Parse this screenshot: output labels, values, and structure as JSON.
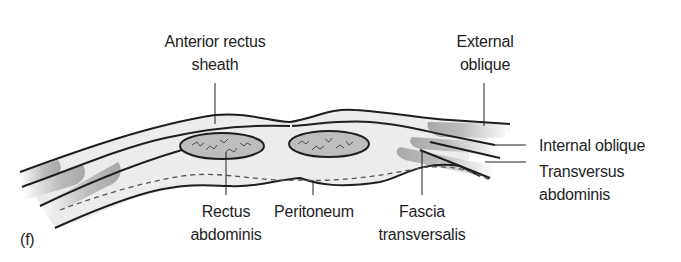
{
  "figure": {
    "panel_label": "(f)",
    "colors": {
      "outline": "#1e1e1e",
      "sheath_fill": "#ececec",
      "muscle_fill": "#c9c9c9",
      "rectus_fill": "#bdbdbd",
      "background": "#ffffff"
    },
    "labels": {
      "anterior_rectus_sheath": {
        "line1": "Anterior rectus",
        "line2": "sheath"
      },
      "external_oblique": {
        "line1": "External",
        "line2": "oblique"
      },
      "internal_oblique": {
        "line1": "Internal oblique"
      },
      "transversus_abdominis": {
        "line1": "Transversus",
        "line2": "abdominis"
      },
      "rectus_abdominis": {
        "line1": "Rectus",
        "line2": "abdominis"
      },
      "peritoneum": {
        "line1": "Peritoneum"
      },
      "fascia_transversalis": {
        "line1": "Fascia",
        "line2": "transversalis"
      }
    }
  }
}
